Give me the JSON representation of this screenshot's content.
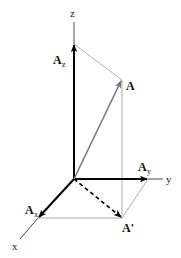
{
  "diagram": {
    "type": "3d-vector-components",
    "origin": [
      74,
      179
    ],
    "axes": [
      {
        "name": "z",
        "label": "z",
        "from": [
          74,
          179
        ],
        "to": [
          74,
          22
        ]
      },
      {
        "name": "y",
        "label": "y",
        "from": [
          74,
          179
        ],
        "to": [
          163,
          179
        ]
      },
      {
        "name": "x",
        "label": "x",
        "from": [
          74,
          179
        ],
        "to": [
          20,
          239
        ]
      }
    ],
    "vectors": [
      {
        "name": "A",
        "label": "A",
        "subscript": "",
        "tip": [
          122,
          80
        ],
        "color": "#7a7a7a"
      },
      {
        "name": "Az",
        "label": "A",
        "subscript": "z",
        "tip": [
          74,
          44
        ],
        "color": "#000000"
      },
      {
        "name": "Ay",
        "label": "A",
        "subscript": "y",
        "tip": [
          148,
          179
        ],
        "color": "#000000"
      },
      {
        "name": "Ax",
        "label": "A",
        "subscript": "x",
        "tip": [
          38,
          218
        ],
        "color": "#000000"
      },
      {
        "name": "A-prime",
        "label": "A′",
        "subscript": "",
        "tip": [
          122,
          218
        ],
        "style": "dashed",
        "color": "#000000"
      }
    ],
    "labels": {
      "z": "z",
      "y": "y",
      "x": "x",
      "A": "A",
      "Az_main": "A",
      "Az_sub": "z",
      "Ay_main": "A",
      "Ay_sub": "y",
      "Ax_main": "A",
      "Ax_sub": "x",
      "A_prime": "A′"
    },
    "construction_line_color": "#9a9a9a"
  }
}
